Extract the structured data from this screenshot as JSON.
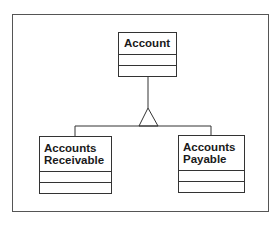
{
  "diagram": {
    "type": "uml-class-diagram",
    "relationship": "generalization",
    "superclass": {
      "name": "Account",
      "attributes": [],
      "operations": []
    },
    "subclasses": [
      {
        "name": "Accounts\nReceivable",
        "attributes": [],
        "operations": []
      },
      {
        "name": "Accounts\nPayable",
        "attributes": [],
        "operations": []
      }
    ]
  },
  "colors": {
    "line": "#333333",
    "frame": "#555555",
    "text": "#1a1a1a",
    "background": "#ffffff"
  }
}
